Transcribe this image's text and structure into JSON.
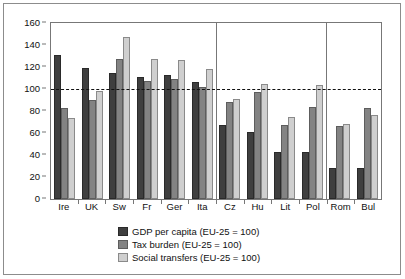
{
  "chart_data": {
    "type": "bar",
    "title": "",
    "xlabel": "",
    "ylabel": "",
    "ylim": [
      0,
      160
    ],
    "yticks": [
      0,
      20,
      40,
      60,
      80,
      100,
      120,
      140,
      160
    ],
    "grid": false,
    "legend_position": "bottom",
    "reference_line": {
      "value": 100,
      "style": "dashed"
    },
    "group_separators": [
      6,
      10
    ],
    "categories": [
      "Ire",
      "UK",
      "Sw",
      "Fr",
      "Ger",
      "Ita",
      "Cz",
      "Hu",
      "Lit",
      "Pol",
      "Rom",
      "Bul"
    ],
    "series": [
      {
        "name": "GDP per capita (EU-25 = 100)",
        "color": "#3f3f3f",
        "values": [
          131,
          119,
          115,
          111,
          113,
          106,
          67,
          61,
          43,
          43,
          28,
          28
        ]
      },
      {
        "name": "Tax burden (EU-25 = 100)",
        "color": "#838383",
        "values": [
          83,
          90,
          127,
          107,
          109,
          102,
          88,
          97,
          67,
          84,
          66,
          83
        ]
      },
      {
        "name": "Social transfers (EU-25 = 100)",
        "color": "#cfcfcf",
        "values": [
          74,
          98,
          147,
          127,
          126,
          118,
          91,
          105,
          75,
          104,
          68,
          76
        ]
      }
    ]
  },
  "legend": {
    "items": [
      {
        "label": "GDP per capita (EU-25 = 100)"
      },
      {
        "label": "Tax burden (EU-25 = 100)"
      },
      {
        "label": "Social transfers (EU-25 = 100)"
      }
    ]
  }
}
